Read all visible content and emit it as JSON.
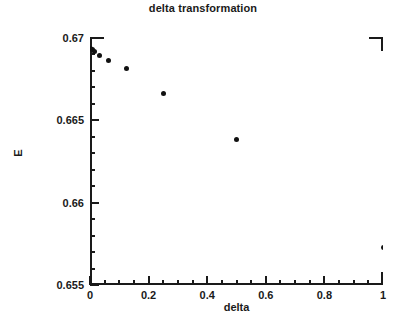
{
  "chart_data": {
    "type": "scatter",
    "title": "delta transformation",
    "xlabel": "delta",
    "ylabel": "E",
    "xlim": [
      0,
      1
    ],
    "ylim": [
      0.655,
      0.67
    ],
    "grid": false,
    "legend": null,
    "x": [
      0,
      0.0078,
      0.0156,
      0.03125,
      0.0625,
      0.125,
      0.25,
      0.5,
      1
    ],
    "y": [
      0.66935,
      0.66928,
      0.66918,
      0.66895,
      0.66865,
      0.66815,
      0.66665,
      0.66385,
      0.65725
    ],
    "series": [
      {
        "name": "E vs delta",
        "marker": "filled-circle",
        "color": "#111111",
        "points": [
          {
            "x": 0,
            "y": 0.66935
          },
          {
            "x": 0.0078,
            "y": 0.66928
          },
          {
            "x": 0.0156,
            "y": 0.66918
          },
          {
            "x": 0.03125,
            "y": 0.66895
          },
          {
            "x": 0.0625,
            "y": 0.66865
          },
          {
            "x": 0.125,
            "y": 0.66815
          },
          {
            "x": 0.25,
            "y": 0.66665
          },
          {
            "x": 0.5,
            "y": 0.66385
          },
          {
            "x": 1,
            "y": 0.65725
          }
        ]
      }
    ],
    "x_ticks_major": [
      0,
      0.2,
      0.4,
      0.6,
      0.8,
      1
    ],
    "x_tick_labels": [
      "0",
      "0.2",
      "0.4",
      "0.6",
      "0.8",
      "1"
    ],
    "x_ticks_minor_step": 0.05,
    "y_ticks_major": [
      0.655,
      0.66,
      0.665,
      0.67
    ],
    "y_tick_labels": [
      "0.655",
      "0.66",
      "0.665",
      "0.67"
    ],
    "y_ticks_minor_step": 0.001
  },
  "axis_color": "#1a1a1a",
  "marker_color": "#111111",
  "background": "#ffffff"
}
